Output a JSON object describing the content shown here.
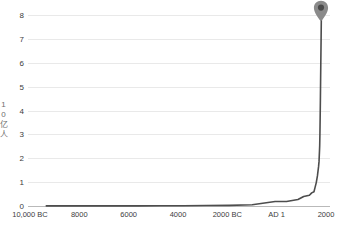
{
  "chart_data": {
    "type": "line",
    "title": "",
    "subtitle": "",
    "xlabel": "",
    "ylabel": "10亿人",
    "ylabel_chars": [
      "1",
      "0",
      "亿",
      "人"
    ],
    "x_tick_labels": [
      "10,000 BC",
      "8000",
      "6000",
      "4000",
      "2000 BC",
      "AD 1",
      "2000"
    ],
    "x_tick_values": [
      -10000,
      -8000,
      -6000,
      -4000,
      -2000,
      1,
      2000
    ],
    "y_tick_labels": [
      "0",
      "1",
      "2",
      "3",
      "4",
      "5",
      "6",
      "7",
      "8"
    ],
    "y_tick_values": [
      0,
      1,
      2,
      3,
      4,
      5,
      6,
      7,
      8
    ],
    "ylim": [
      0,
      8.3
    ],
    "xlim": [
      -10800,
      2400
    ],
    "grid": true,
    "legend": false,
    "series": [
      {
        "name": "世界人口",
        "color": "#4d4d4d",
        "x": [
          -10000,
          -9000,
          -8000,
          -7000,
          -6000,
          -5000,
          -4000,
          -3000,
          -2000,
          -1000,
          1,
          500,
          1000,
          1250,
          1500,
          1600,
          1700,
          1750,
          1800,
          1850,
          1900,
          1920,
          1940,
          1950,
          1960,
          1970,
          1980,
          1990,
          2000,
          2011,
          2022
        ],
        "y": [
          0.004,
          0.005,
          0.005,
          0.006,
          0.007,
          0.009,
          0.012,
          0.018,
          0.027,
          0.05,
          0.19,
          0.19,
          0.27,
          0.4,
          0.45,
          0.55,
          0.6,
          0.79,
          0.98,
          1.26,
          1.65,
          1.86,
          2.3,
          2.53,
          3.03,
          3.7,
          4.44,
          5.32,
          6.14,
          7.0,
          7.95
        ]
      }
    ],
    "annotations": [
      {
        "name": "current-position-pin",
        "icon": "map-pin-icon",
        "x": 2022,
        "y": 8.3,
        "color": "#8a8a8a",
        "inner_color": "#4a4a4a",
        "label": ""
      }
    ],
    "colors": {
      "line": "#4d4d4d",
      "gridline": "#e9e9e9",
      "axis": "#b9b9b9",
      "tick_text": "#3c3c3c",
      "axis_title_text": "#6d6d6d",
      "background": "#ffffff",
      "pin": "#8a8a8a",
      "pin_inner": "#4a4a4a"
    }
  }
}
